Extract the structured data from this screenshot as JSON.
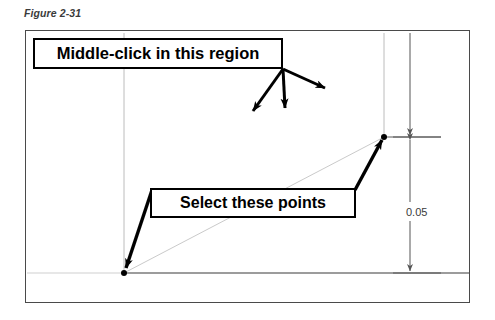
{
  "figure": {
    "caption": "Figure 2-31"
  },
  "callouts": [
    {
      "id": "middle-click",
      "label": "Middle-click in this region",
      "arrow_count": 3,
      "origin": {
        "x": 283,
        "y": 69
      }
    },
    {
      "id": "select-points",
      "label": "Select these points",
      "arrow_count": 2,
      "targets": [
        {
          "x": 124,
          "y": 273
        },
        {
          "x": 384,
          "y": 137
        }
      ]
    }
  ],
  "dimension": {
    "value": "0.05",
    "orientation": "vertical",
    "from_y": 137,
    "to_y": 273,
    "x": 410
  },
  "points": [
    {
      "name": "lower-left-point",
      "x": 124,
      "y": 273
    },
    {
      "name": "upper-right-point",
      "x": 384,
      "y": 137
    }
  ],
  "colors": {
    "ink": "#000000",
    "frame": "#4a4a4a",
    "construction_line": "#b9b9b9",
    "dimension_line": "#555555",
    "geometry_line": "#3a3a3a",
    "caption": "#3b3b3b",
    "background": "#ffffff"
  }
}
